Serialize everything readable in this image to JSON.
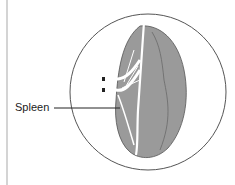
{
  "diagram": {
    "title": "",
    "labels": [
      {
        "text": "Spleen",
        "target": "spleen-organ"
      }
    ],
    "colors": {
      "organ_fill": "#9a9a9a",
      "vessel": "#ffffff",
      "outline": "#555555",
      "circle": "#555555"
    }
  }
}
